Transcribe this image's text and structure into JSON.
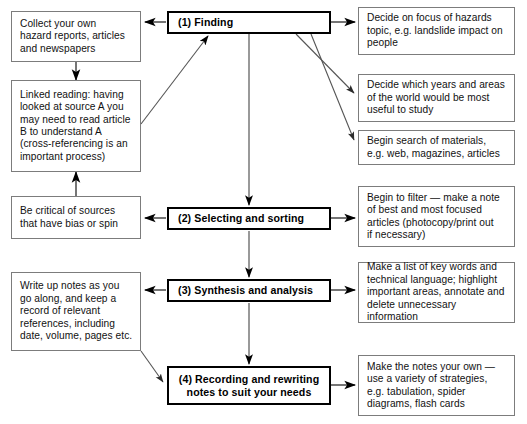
{
  "diagram": {
    "type": "flowchart",
    "colors": {
      "stage_border": "#000000",
      "side_border": "#7c7c7c",
      "arrow": "#3a3a3a",
      "background": "#ffffff",
      "text": "#111111"
    },
    "caption": "",
    "stages": [
      {
        "id": "stage-1",
        "lines": [
          "(1) Finding"
        ]
      },
      {
        "id": "stage-2",
        "lines": [
          "(2) Selecting and sorting"
        ]
      },
      {
        "id": "stage-3",
        "lines": [
          "(3) Synthesis and analysis"
        ]
      },
      {
        "id": "stage-4",
        "lines": [
          "(4) Recording and rewriting",
          "notes to suit your needs"
        ]
      }
    ],
    "left_notes": [
      {
        "id": "collect-own-reports",
        "lines": [
          "Collect your own",
          "hazard reports, articles",
          "and newspapers"
        ]
      },
      {
        "id": "linked-reading",
        "lines": [
          "Linked reading: having",
          "looked at source A you",
          "may need to read article",
          "B to understand A",
          "(cross-referencing is an",
          "important process)"
        ]
      },
      {
        "id": "be-critical-of-sources",
        "lines": [
          "Be critical of sources",
          "that have bias or spin"
        ]
      },
      {
        "id": "write-up-notes",
        "lines": [
          "Write up notes as you",
          "go along, and keep a",
          "record of relevant",
          "references, including",
          "date, volume, pages etc."
        ]
      }
    ],
    "right_notes": [
      {
        "id": "decide-focus",
        "lines": [
          "Decide on focus of hazards",
          "topic, e.g. landslide impact on",
          "people"
        ]
      },
      {
        "id": "decide-years-areas",
        "lines": [
          "Decide which years and areas",
          "of the world would be most",
          "useful to study"
        ]
      },
      {
        "id": "begin-search-materials",
        "lines": [
          "Begin search of materials,",
          "e.g. web, magazines, articles"
        ]
      },
      {
        "id": "begin-to-filter",
        "lines": [
          "Begin to filter — make a note",
          "of best and most focused",
          "articles (photocopy/print out",
          "if necessary)"
        ]
      },
      {
        "id": "key-words-technical-language",
        "lines": [
          "Make a list of key words and",
          "technical language; highlight",
          "important areas, annotate and",
          "delete unnecessary information"
        ]
      },
      {
        "id": "make-notes-your-own",
        "lines": [
          "Make the notes your own —",
          "use a variety of strategies,",
          "e.g. tabulation, spider",
          "diagrams, flash cards"
        ]
      }
    ]
  }
}
